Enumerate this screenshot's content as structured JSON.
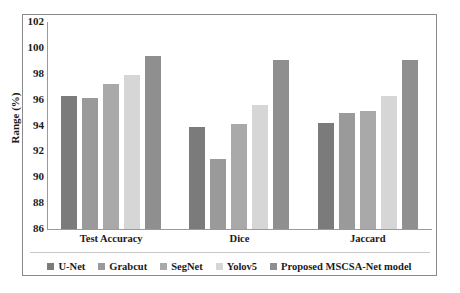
{
  "chart_data": {
    "type": "bar",
    "title": "",
    "subtitle": "",
    "xlabel": "",
    "ylabel": "Range (%)",
    "categories": [
      "Test Accuracy",
      "Dice",
      "Jaccard"
    ],
    "ylim": [
      86,
      102
    ],
    "ytick_labels": [
      "102",
      "100",
      "98",
      "96",
      "94",
      "92",
      "90",
      "88",
      "86"
    ],
    "yticks": [
      102,
      100,
      98,
      96,
      94,
      92,
      90,
      88,
      86
    ],
    "grid": false,
    "legend_position": "bottom",
    "series": [
      {
        "name": "U-Net",
        "color": "#7b7b7b",
        "values": [
          96.3,
          93.9,
          94.2
        ]
      },
      {
        "name": "Grabcut",
        "color": "#9a9a9a",
        "values": [
          96.1,
          91.4,
          95.0
        ]
      },
      {
        "name": "SegNet",
        "color": "#a9a9a9",
        "values": [
          97.2,
          94.1,
          95.1
        ]
      },
      {
        "name": "Yolov5",
        "color": "#d6d6d6",
        "values": [
          97.9,
          95.6,
          96.3
        ]
      },
      {
        "name": "Proposed MSCSA-Net model",
        "color": "#8f8f8f",
        "values": [
          99.4,
          99.1,
          99.1
        ]
      }
    ]
  }
}
